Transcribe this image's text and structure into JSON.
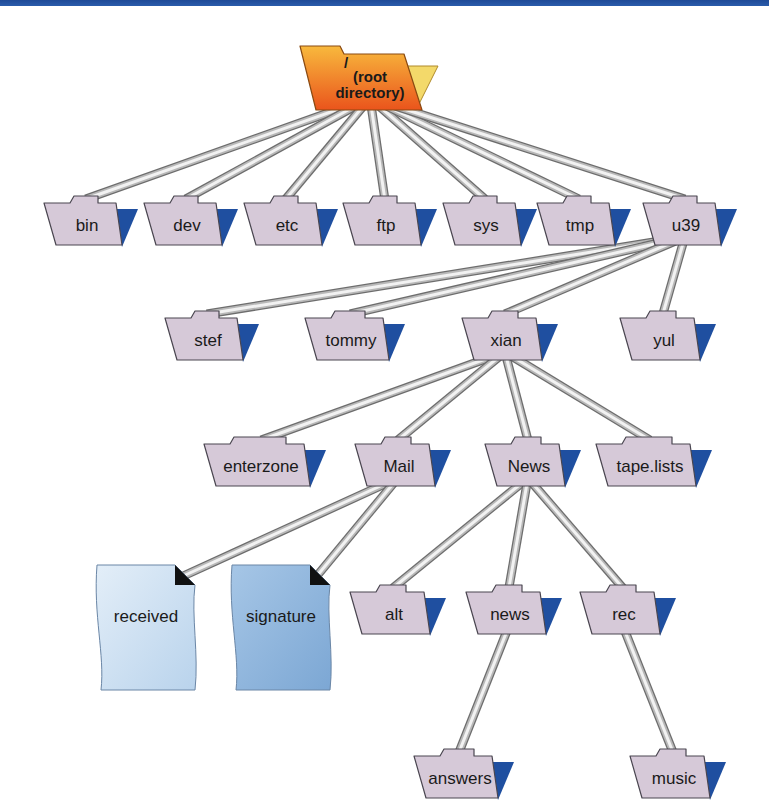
{
  "diagram": {
    "type": "directory-tree",
    "colors": {
      "folder_fill": "#d6c9d8",
      "folder_stroke": "#4a4650",
      "folder_flap": "#1f4fa0",
      "root_fill_top": "#f7b03a",
      "root_fill_bottom": "#ec5a1e",
      "root_flap": "#f3d96a",
      "file_received": "#cfe2f3",
      "file_signature": "#8fb6dd",
      "connector_light": "#f2f2f2",
      "connector_dark": "#6d6d6d",
      "top_bar": "#1e4a97"
    },
    "root": {
      "id": "root",
      "slash": "/",
      "line1": "(root",
      "line2": "directory)"
    },
    "nodes": [
      {
        "id": "bin",
        "label": "bin",
        "parent": "root",
        "kind": "folder"
      },
      {
        "id": "dev",
        "label": "dev",
        "parent": "root",
        "kind": "folder"
      },
      {
        "id": "etc",
        "label": "etc",
        "parent": "root",
        "kind": "folder"
      },
      {
        "id": "ftp",
        "label": "ftp",
        "parent": "root",
        "kind": "folder"
      },
      {
        "id": "sys",
        "label": "sys",
        "parent": "root",
        "kind": "folder"
      },
      {
        "id": "tmp",
        "label": "tmp",
        "parent": "root",
        "kind": "folder"
      },
      {
        "id": "u39",
        "label": "u39",
        "parent": "root",
        "kind": "folder"
      },
      {
        "id": "stef",
        "label": "stef",
        "parent": "u39",
        "kind": "folder"
      },
      {
        "id": "tommy",
        "label": "tommy",
        "parent": "u39",
        "kind": "folder"
      },
      {
        "id": "xian",
        "label": "xian",
        "parent": "u39",
        "kind": "folder"
      },
      {
        "id": "yul",
        "label": "yul",
        "parent": "u39",
        "kind": "folder"
      },
      {
        "id": "enterzone",
        "label": "enterzone",
        "parent": "xian",
        "kind": "folder"
      },
      {
        "id": "Mail",
        "label": "Mail",
        "parent": "xian",
        "kind": "folder"
      },
      {
        "id": "News",
        "label": "News",
        "parent": "xian",
        "kind": "folder"
      },
      {
        "id": "tape.lists",
        "label": "tape.lists",
        "parent": "xian",
        "kind": "folder"
      },
      {
        "id": "received",
        "label": "received",
        "parent": "Mail",
        "kind": "file"
      },
      {
        "id": "signature",
        "label": "signature",
        "parent": "Mail",
        "kind": "file"
      },
      {
        "id": "alt",
        "label": "alt",
        "parent": "News",
        "kind": "folder"
      },
      {
        "id": "news",
        "label": "news",
        "parent": "News",
        "kind": "folder"
      },
      {
        "id": "rec",
        "label": "rec",
        "parent": "News",
        "kind": "folder"
      },
      {
        "id": "answers",
        "label": "answers",
        "parent": "news",
        "kind": "folder"
      },
      {
        "id": "music",
        "label": "music",
        "parent": "rec",
        "kind": "folder"
      }
    ]
  }
}
